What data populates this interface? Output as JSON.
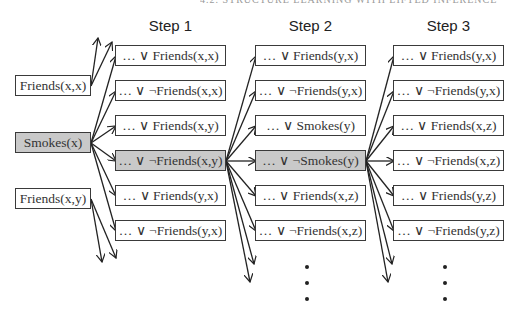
{
  "running_header": "4.2. STRUCTURE LEARNING WITH LIFTED INFERENCE",
  "steps": [
    {
      "title": "Step 1"
    },
    {
      "title": "Step 2"
    },
    {
      "title": "Step 3"
    }
  ],
  "initial_literals": [
    {
      "label": "Friends(x,x)",
      "shaded": false
    },
    {
      "label": "Smokes(x)",
      "shaded": true
    },
    {
      "label": "Friends(x,y)",
      "shaded": false
    }
  ],
  "step1_clauses": [
    {
      "label": "… ∨ Friends(x,x)",
      "shaded": false
    },
    {
      "label": "… ∨ ¬Friends(x,x)",
      "shaded": false
    },
    {
      "label": "… ∨ Friends(x,y)",
      "shaded": false
    },
    {
      "label": "… ∨ ¬Friends(x,y)",
      "shaded": true
    },
    {
      "label": "… ∨ Friends(y,x)",
      "shaded": false
    },
    {
      "label": "… ∨ ¬Friends(y,x)",
      "shaded": false
    }
  ],
  "step2_clauses": [
    {
      "label": "… ∨ Friends(y,x)",
      "shaded": false
    },
    {
      "label": "… ∨ ¬Friends(y,x)",
      "shaded": false
    },
    {
      "label": "… ∨ Smokes(y)",
      "shaded": false
    },
    {
      "label": "… ∨ ¬Smokes(y)",
      "shaded": true
    },
    {
      "label": "… ∨ Friends(x,z)",
      "shaded": false
    },
    {
      "label": "… ∨ ¬Friends(x,z)",
      "shaded": false
    }
  ],
  "step3_clauses": [
    {
      "label": "… ∨ Friends(y,x)",
      "shaded": false
    },
    {
      "label": "… ∨ ¬Friends(y,x)",
      "shaded": false
    },
    {
      "label": "… ∨ Friends(x,z)",
      "shaded": false
    },
    {
      "label": "… ∨ ¬Friends(x,z)",
      "shaded": false
    },
    {
      "label": "… ∨ Friends(y,z)",
      "shaded": false
    },
    {
      "label": "… ∨ ¬Friends(y,z)",
      "shaded": false
    }
  ],
  "continuation": "⋮",
  "colors": {
    "shaded_fill": "#c9c9c9",
    "border": "#3a3a3a",
    "arrow": "#222222"
  }
}
